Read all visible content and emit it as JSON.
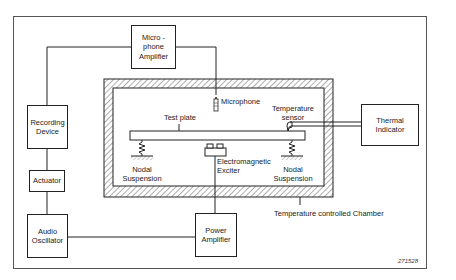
{
  "diagram": {
    "type": "block-diagram",
    "blocks": {
      "mic_amp": [
        "Micro -",
        "phone",
        "Amplifier"
      ],
      "recording": [
        "Recording",
        "Device"
      ],
      "actuator": [
        "Actuator"
      ],
      "audio_osc": [
        "Audio",
        "Oscillator"
      ],
      "power_amp": [
        "Power",
        "Amplifier"
      ],
      "thermal": [
        "Thermal",
        "Indicator"
      ]
    },
    "labels": {
      "microphone": "Microphone",
      "temp_sensor_1": "Temperature",
      "temp_sensor_2": "sensor",
      "test_plate": "Test plate",
      "exciter_1": "Electromagnetic",
      "exciter_2": "Exciter",
      "nodal_left_1": "Nodal",
      "nodal_left_2": "Suspension",
      "nodal_right_1": "Nodal",
      "nodal_right_2": "Suspension",
      "chamber": "Temperature controlled Chamber"
    },
    "figure_code": "271528",
    "connections": [
      [
        "Microphone",
        "Microphone Amplifier"
      ],
      [
        "Microphone Amplifier",
        "Recording Device"
      ],
      [
        "Recording Device",
        "Actuator"
      ],
      [
        "Actuator",
        "Audio Oscillator"
      ],
      [
        "Audio Oscillator",
        "Power Amplifier"
      ],
      [
        "Power Amplifier",
        "Electromagnetic Exciter"
      ],
      [
        "Temperature sensor",
        "Thermal Indicator"
      ]
    ]
  }
}
